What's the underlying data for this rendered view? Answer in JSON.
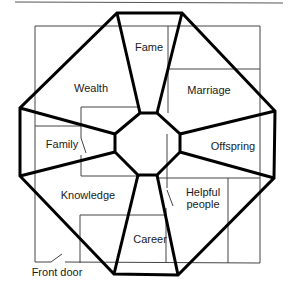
{
  "diagram": {
    "areas": [
      {
        "id": "fame",
        "label": "Fame"
      },
      {
        "id": "wealth",
        "label": "Wealth"
      },
      {
        "id": "marriage",
        "label": "Marriage"
      },
      {
        "id": "family",
        "label": "Family"
      },
      {
        "id": "offspring",
        "label": "Offspring"
      },
      {
        "id": "knowledge",
        "label": "Knowledge"
      },
      {
        "id": "helpful_people",
        "label_line1": "Helpful",
        "label_line2": "people"
      },
      {
        "id": "career",
        "label": "Career"
      }
    ],
    "front_door_label": "Front door"
  }
}
